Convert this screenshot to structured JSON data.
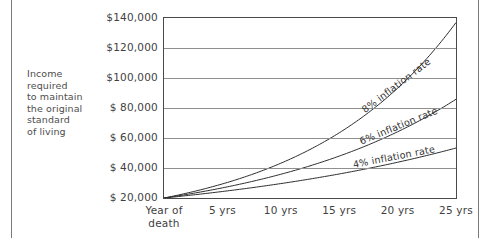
{
  "caption": {
    "lines": [
      "Income",
      "required",
      "to maintain",
      "the original",
      "standard",
      "of living"
    ]
  },
  "chart_data": {
    "type": "line",
    "title": "",
    "xlabel": "",
    "ylabel": "Income required to maintain the original standard of living",
    "x": [
      0,
      5,
      10,
      15,
      20,
      25
    ],
    "categories": [
      "Year of death",
      "5 yrs",
      "10 yrs",
      "15 yrs",
      "20 yrs",
      "25 yrs"
    ],
    "xtick_labels": [
      {
        "line1": "Year of",
        "line2": "death"
      },
      {
        "line1": "5 yrs",
        "line2": ""
      },
      {
        "line1": "10 yrs",
        "line2": ""
      },
      {
        "line1": "15 yrs",
        "line2": ""
      },
      {
        "line1": "20 yrs",
        "line2": ""
      },
      {
        "line1": "25 yrs",
        "line2": ""
      }
    ],
    "ytick_labels": [
      "$140,000",
      "$120,000",
      "$100,000",
      "$ 80,000",
      "$ 60,000",
      "$ 40,000",
      "$ 20,000"
    ],
    "ytick_values": [
      140000,
      120000,
      100000,
      80000,
      60000,
      40000,
      20000
    ],
    "ylim": [
      20000,
      140000
    ],
    "xlim": [
      0,
      25
    ],
    "grid": true,
    "legend_position": "inline-curve-labels",
    "series": [
      {
        "name": "8% inflation rate",
        "rate": 0.08,
        "values": [
          20000,
          29387,
          43178,
          63443,
          93219,
          136970
        ]
      },
      {
        "name": "6% inflation rate",
        "rate": 0.06,
        "values": [
          20000,
          26765,
          35817,
          47931,
          64143,
          85837
        ]
      },
      {
        "name": "4% inflation rate",
        "rate": 0.04,
        "values": [
          20000,
          24333,
          29605,
          36019,
          43822,
          53317
        ]
      }
    ],
    "annotations": [
      {
        "text": "8% inflation rate",
        "series": "8% inflation rate"
      },
      {
        "text": "6% inflation rate",
        "series": "6% inflation rate"
      },
      {
        "text": "4% inflation rate",
        "series": "4% inflation rate"
      }
    ]
  }
}
